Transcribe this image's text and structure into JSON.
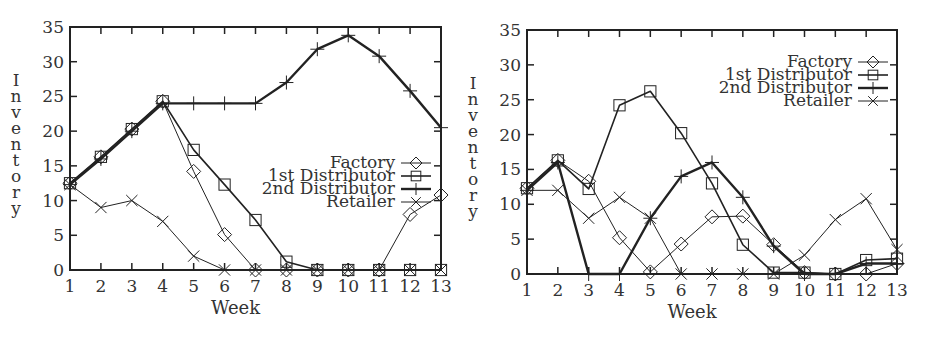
{
  "chart_data": [
    {
      "type": "line",
      "title": "",
      "xlabel": "Week",
      "ylabel": "Inventory",
      "x": [
        1,
        2,
        3,
        4,
        5,
        6,
        7,
        8,
        9,
        10,
        11,
        12,
        13
      ],
      "ylim": [
        0,
        35
      ],
      "yticks": [
        0,
        5,
        10,
        15,
        20,
        25,
        30,
        35
      ],
      "grid": false,
      "legend_position": "inside-right-middle",
      "series": [
        {
          "name": "Factory",
          "marker": "diamond",
          "width": 1,
          "values": [
            12.5,
            16.3,
            20.3,
            24.3,
            14.2,
            5.1,
            0,
            0,
            0,
            0,
            0,
            8,
            10.8
          ]
        },
        {
          "name": "1st Distributor",
          "marker": "square",
          "width": 1.6,
          "values": [
            12.5,
            16.3,
            20.3,
            24.3,
            17.3,
            12.3,
            7.2,
            1.2,
            0,
            0,
            0,
            0,
            0
          ]
        },
        {
          "name": "2nd Distributor",
          "marker": "plus",
          "width": 2.4,
          "values": [
            12.3,
            16,
            20,
            24,
            24,
            24,
            24,
            27,
            31.8,
            33.8,
            30.8,
            25.8,
            20.5
          ]
        },
        {
          "name": "Retailer",
          "marker": "cross",
          "width": 1,
          "values": [
            12.3,
            9,
            10,
            7,
            2,
            0,
            0,
            0,
            0,
            0,
            0,
            0,
            0
          ]
        }
      ]
    },
    {
      "type": "line",
      "title": "",
      "xlabel": "Week",
      "ylabel": "Inventory",
      "x": [
        1,
        2,
        3,
        4,
        5,
        6,
        7,
        8,
        9,
        10,
        11,
        12,
        13
      ],
      "ylim": [
        0,
        35
      ],
      "yticks": [
        0,
        5,
        10,
        15,
        20,
        25,
        30,
        35
      ],
      "grid": false,
      "legend_position": "inside-right-top",
      "series": [
        {
          "name": "Factory",
          "marker": "diamond",
          "width": 1,
          "values": [
            12.3,
            16.3,
            13.3,
            5.2,
            0.3,
            4.3,
            8.2,
            8.3,
            4.2,
            0.2,
            0,
            0,
            1.5
          ]
        },
        {
          "name": "1st Distributor",
          "marker": "square",
          "width": 1.6,
          "values": [
            12.3,
            16.3,
            12.2,
            24.2,
            26.2,
            20.2,
            13,
            4.2,
            0.2,
            0.2,
            0,
            2,
            2.2
          ]
        },
        {
          "name": "2nd Distributor",
          "marker": "plus",
          "width": 2.4,
          "values": [
            12,
            16,
            0,
            0,
            8,
            14,
            16,
            11,
            4,
            0,
            0,
            1.5,
            1.5
          ]
        },
        {
          "name": "Retailer",
          "marker": "cross",
          "width": 1,
          "values": [
            12,
            12,
            8,
            11,
            8,
            0,
            0,
            0,
            0,
            2.7,
            7.8,
            10.8,
            3.5
          ]
        }
      ]
    }
  ]
}
